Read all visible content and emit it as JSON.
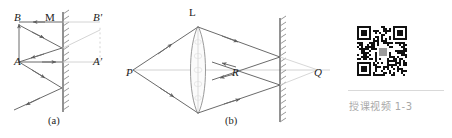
{
  "figure": {
    "panel_a": {
      "caption": "(a)",
      "labels": {
        "object_top": "B",
        "object_bottom": "A",
        "mirror_point": "M",
        "image_top": "B'",
        "image_bottom": "A'"
      },
      "mirror": {
        "x": 63,
        "y_top": 12,
        "y_bottom": 112,
        "hatch_side": "right"
      },
      "object": {
        "top": [
          19,
          22
        ],
        "bottom": [
          19,
          62
        ]
      },
      "image": {
        "top": [
          100,
          22
        ],
        "bottom": [
          100,
          62
        ]
      }
    },
    "panel_b": {
      "caption": "(b)",
      "labels": {
        "source": "P",
        "lens": "L",
        "focus": "R",
        "image": "Q"
      },
      "axis": {
        "y": 70,
        "x_start": 126,
        "x_end": 330
      },
      "lens": {
        "x": 198,
        "y_top": 26,
        "y_bottom": 114
      },
      "mirror": {
        "x": 280,
        "y_top": 18,
        "y_bottom": 122,
        "hatch_side": "right"
      },
      "points": {
        "P": [
          133,
          70
        ],
        "R": [
          237,
          70
        ],
        "Q": [
          318,
          70
        ]
      }
    }
  },
  "qr": {
    "caption": "授课视频 1-3",
    "alt": "qr-code"
  },
  "colors": {
    "ink": "#1c1c1c",
    "ray": "#6b6b6b",
    "faint": "#c9c9c9",
    "caption_gray": "#a8a8a8",
    "rule": "#d9d9d9"
  }
}
